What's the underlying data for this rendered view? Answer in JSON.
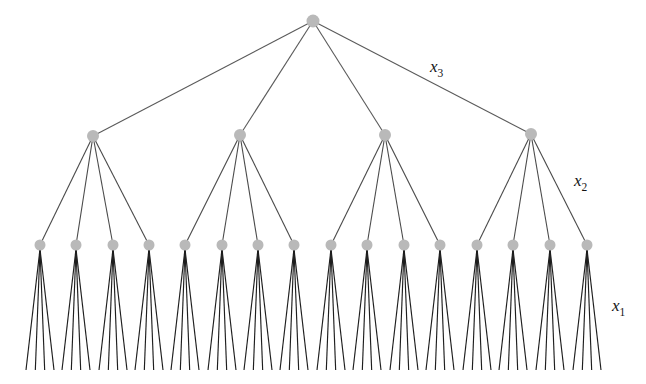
{
  "figure": {
    "background_color": "#ffffff",
    "width": 646,
    "height": 384
  },
  "labels": [
    {
      "id": "x3",
      "base": "x",
      "sub": "3",
      "text": "x3",
      "x": 430,
      "y": 72
    },
    {
      "id": "x2",
      "base": "x",
      "sub": "2",
      "text": "x2",
      "x": 574,
      "y": 186
    },
    {
      "id": "x1",
      "base": "x",
      "sub": "1",
      "text": "x1",
      "x": 612,
      "y": 311
    }
  ],
  "colors": {
    "node_fill": "#b9b9b9",
    "edge_level3": "#5a5a5a",
    "edge_level2": "#4a4a4a",
    "edge_level1": "#1e1e1e",
    "label_text": "#141414",
    "background": "#ffffff"
  },
  "tree": {
    "branching_factor": 4,
    "levels": 4,
    "level_names": [
      "root",
      "x3-children",
      "x2-children",
      "x1-leaves"
    ],
    "node_radius_root": 6.5,
    "node_radius_l2": 6.0,
    "node_radius_l3": 5.5,
    "root": {
      "x": 313,
      "y": 21
    },
    "level2_y": 135,
    "level3_y": 245,
    "leaf_y": 370,
    "level2_nodes": [
      {
        "x": 93,
        "y": 136
      },
      {
        "x": 240,
        "y": 135
      },
      {
        "x": 385,
        "y": 135
      },
      {
        "x": 531,
        "y": 134
      }
    ],
    "level3_nodes": [
      {
        "x": 40,
        "y": 245
      },
      {
        "x": 76,
        "y": 245
      },
      {
        "x": 113,
        "y": 245
      },
      {
        "x": 149,
        "y": 245
      },
      {
        "x": 185,
        "y": 245
      },
      {
        "x": 222,
        "y": 245
      },
      {
        "x": 258,
        "y": 245
      },
      {
        "x": 294,
        "y": 245
      },
      {
        "x": 331,
        "y": 245
      },
      {
        "x": 367,
        "y": 245
      },
      {
        "x": 404,
        "y": 245
      },
      {
        "x": 440,
        "y": 245
      },
      {
        "x": 477,
        "y": 245
      },
      {
        "x": 513,
        "y": 245
      },
      {
        "x": 550,
        "y": 245
      },
      {
        "x": 587,
        "y": 245
      }
    ],
    "leaf_fan": {
      "children_per_node": 4,
      "half_spread": 14,
      "bottom_y": 370
    }
  },
  "chart_data": {
    "type": "tree",
    "node_counts_per_level": [
      1,
      4,
      16,
      64
    ],
    "edge_labels": [
      "x3",
      "x2",
      "x1"
    ],
    "edge_label_meaning": {
      "x3": "edges from the root to the 4 level-2 nodes",
      "x2": "edges from each level-2 node to its 4 level-3 nodes",
      "x1": "edges from each level-3 node to its 4 leaves"
    },
    "grid": false,
    "legend": "none",
    "xlabel": "",
    "ylabel": ""
  }
}
